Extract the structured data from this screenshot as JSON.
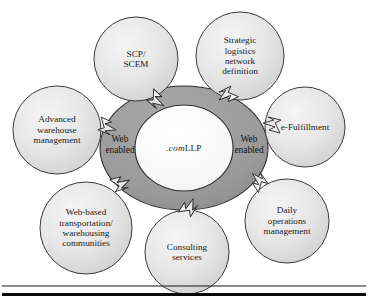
{
  "figure": {
    "hub": {
      "center_label_italic": ".com",
      "center_label_roman": "LLP",
      "center_label_full": ".comLLP",
      "ring_label_left": "Web\nenabled",
      "ring_label_left_line1": "Web",
      "ring_label_left_line2": "enabled",
      "ring_label_right_line1": "Web",
      "ring_label_right_line2": "enabled"
    },
    "nodes": [
      {
        "id": "scp-scem",
        "label": "SCP/\nSCEM",
        "lines": [
          "SCP/",
          "SCEM"
        ]
      },
      {
        "id": "strategic-logistics",
        "label": "Strategic\nlogistics\nnetwork\ndefinition",
        "lines": [
          "Strategic",
          "logistics",
          "network",
          "definition"
        ]
      },
      {
        "id": "e-fulfillment",
        "label": "e-Fulfillment",
        "lines": [
          "e-Fulfillment"
        ]
      },
      {
        "id": "daily-operations",
        "label": "Daily\noperations\nmanagement",
        "lines": [
          "Daily",
          "operations",
          "management"
        ]
      },
      {
        "id": "consulting-services",
        "label": "Consulting\nservices",
        "lines": [
          "Consulting",
          "services"
        ]
      },
      {
        "id": "web-based-transport",
        "label": "Web-based\ntransportation/\nwarehousing\ncommunities",
        "lines": [
          "Web-based",
          "transportation/",
          "warehousing",
          "communities"
        ]
      },
      {
        "id": "advanced-warehouse",
        "label": "Advanced\nwarehouse\nmanagement",
        "lines": [
          "Advanced",
          "warehouse",
          "management"
        ]
      }
    ],
    "connector_count": 7,
    "connector_kind": "lightning-bolt-arrow"
  },
  "colors": {
    "ring_fill": "#9b9b9b",
    "ring_stroke": "#2e2e2e",
    "center_fill": "#fbfbfb",
    "node_fill_light": "#efefef",
    "node_fill_dark": "#d2d2d2",
    "node_stroke": "#3a3a3a",
    "connector_fill": "#e8e8e8",
    "connector_stroke": "#2a2a2a",
    "rule": "#0a0a0a",
    "frame": "#141414",
    "text": "#141414"
  }
}
